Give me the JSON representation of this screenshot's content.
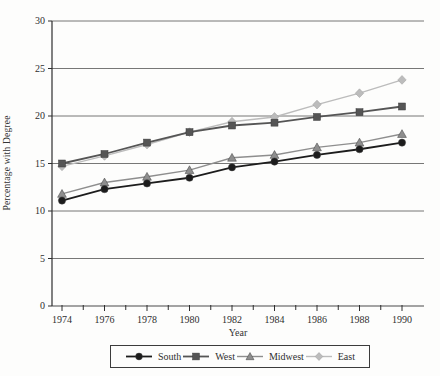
{
  "figure": {
    "background": "#fdfdfc",
    "axis_color": "#2e2e2e",
    "grid_color": "#4a4a4a"
  },
  "chart_data": {
    "type": "line",
    "title": "",
    "xlabel": "Year",
    "ylabel": "Percentage with Degree",
    "x": [
      1974,
      1976,
      1978,
      1980,
      1982,
      1984,
      1986,
      1988,
      1990
    ],
    "xticks": [
      1974,
      1976,
      1978,
      1980,
      1982,
      1984,
      1986,
      1988,
      1990
    ],
    "yticks": [
      0,
      5,
      10,
      15,
      20,
      25,
      30
    ],
    "ylim": [
      0,
      30
    ],
    "grid": true,
    "legend_position": "bottom",
    "series": [
      {
        "name": "South",
        "marker": "circle",
        "color": "#1c1c1c",
        "line_width": 1.8,
        "values": [
          11.1,
          12.3,
          12.9,
          13.5,
          14.6,
          15.2,
          15.9,
          16.5,
          17.2
        ]
      },
      {
        "name": "West",
        "marker": "square",
        "color": "#555555",
        "line_width": 1.8,
        "values": [
          15.0,
          16.0,
          17.2,
          18.3,
          19.0,
          19.3,
          19.9,
          20.4,
          21.0
        ]
      },
      {
        "name": "Midwest",
        "marker": "triangle",
        "color": "#8e8e8e",
        "line_width": 1.4,
        "values": [
          11.8,
          13.0,
          13.6,
          14.3,
          15.6,
          15.9,
          16.7,
          17.2,
          18.1
        ]
      },
      {
        "name": "East",
        "marker": "diamond",
        "color": "#bcbcbc",
        "line_width": 1.4,
        "values": [
          14.7,
          15.8,
          17.0,
          18.3,
          19.4,
          19.9,
          21.2,
          22.4,
          23.8
        ]
      }
    ]
  }
}
